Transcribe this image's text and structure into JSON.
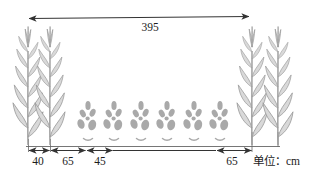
{
  "diagram": {
    "unit_label": "单位：cm",
    "dimensions": {
      "total": "395",
      "corn_row_gap": "40",
      "corn_to_seedlings_left": "65",
      "seedling_gap": "45",
      "seedlings_to_corn_right": "65"
    },
    "plants": {
      "corn_left_count": 2,
      "corn_right_count": 2,
      "seedling_count": 6
    },
    "colors": {
      "dimension_line": "#333333",
      "ground_line": "#666666",
      "corn_fill": "#d9d9d9",
      "corn_stroke": "#9a9a9a",
      "seedling_fill": "#a9a9a9",
      "text": "#1c1c1c",
      "background": "#ffffff"
    }
  }
}
